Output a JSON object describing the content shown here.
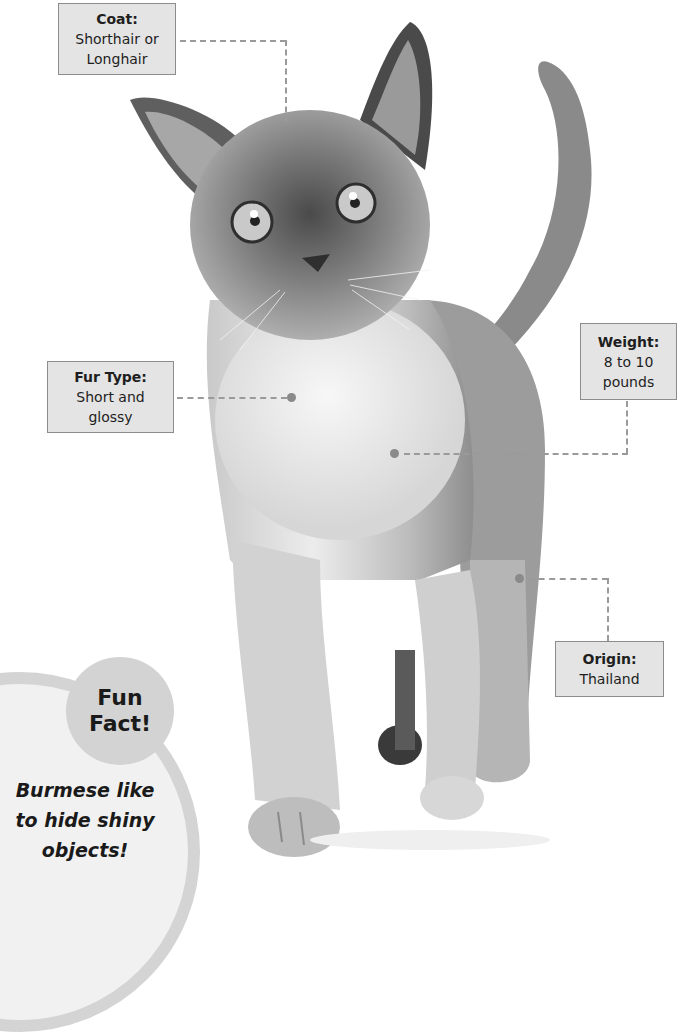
{
  "labels": {
    "coat": {
      "title": "Coat:",
      "value_line1": "Shorthair or",
      "value_line2": "Longhair"
    },
    "fur_type": {
      "title": "Fur Type:",
      "value_line1": "Short and",
      "value_line2": "glossy"
    },
    "weight": {
      "title": "Weight:",
      "value_line1": "8 to 10",
      "value_line2": "pounds"
    },
    "origin": {
      "title": "Origin:",
      "value_line1": "Thailand"
    }
  },
  "fun_fact": {
    "heading_line1": "Fun",
    "heading_line2": "Fact!",
    "text_line1": "Burmese like",
    "text_line2": "to hide shiny",
    "text_line3": "objects!"
  },
  "image": {
    "subject": "burmese-cat-photo"
  },
  "colors": {
    "label_bg": "#e4e4e4",
    "label_border": "#8c8c8c",
    "leader_line": "#9a9a9a",
    "funfact_bubble": "#d3d3d3",
    "funfact_panel": "#f1f1f1"
  }
}
